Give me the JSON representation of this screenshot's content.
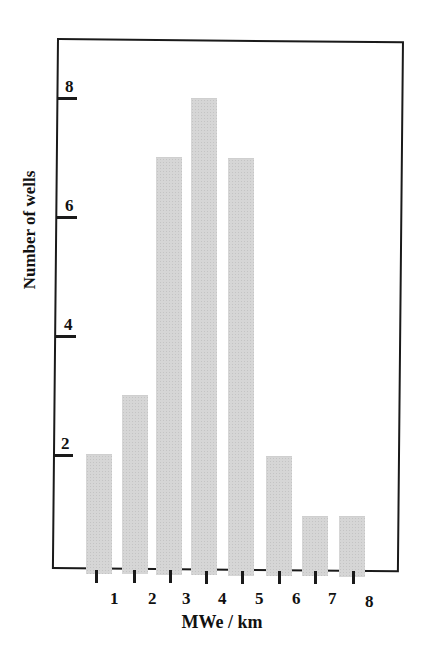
{
  "chart_data": {
    "type": "bar",
    "title": "",
    "xlabel": "MWe / km",
    "ylabel": "Number of wells",
    "categories": [
      "1",
      "2",
      "3",
      "4",
      "5",
      "6",
      "7",
      "8"
    ],
    "values": [
      2,
      3,
      7,
      8,
      7,
      2,
      1,
      1
    ],
    "yticks": [
      "2",
      "4",
      "6",
      "8"
    ],
    "ylim": [
      0,
      9
    ],
    "grid": false,
    "legend": null,
    "bar_color": "#d6d6d6"
  },
  "axes": {
    "x_title": "MWe / km",
    "y_title": "Number of wells",
    "y_tick_labels": [
      "2",
      "4",
      "6",
      "8"
    ],
    "x_tick_labels": [
      "1",
      "2",
      "3",
      "4",
      "5",
      "6",
      "7",
      "8"
    ]
  }
}
